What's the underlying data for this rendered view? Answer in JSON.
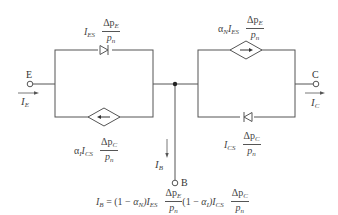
{
  "diagram": {
    "terminals": {
      "emitter": "E",
      "collector": "C",
      "base": "B"
    },
    "currents": {
      "emitter": {
        "symbol": "I",
        "sub": "E"
      },
      "collector": {
        "symbol": "I",
        "sub": "C"
      },
      "base": {
        "symbol": "I",
        "sub": "B"
      }
    },
    "left_branch": {
      "diode_label": {
        "prefix": "I",
        "prefix_sub": "ES",
        "num": "Δp",
        "num_sub": "E",
        "den": "p",
        "den_sub": "n"
      },
      "source_label": {
        "alpha": "α",
        "alpha_sub": "I",
        "prefix": "I",
        "prefix_sub": "CS",
        "num": "Δp",
        "num_sub": "C",
        "den": "p",
        "den_sub": "n"
      },
      "source_direction": "left"
    },
    "right_branch": {
      "source_label": {
        "alpha": "α",
        "alpha_sub": "N",
        "prefix": "I",
        "prefix_sub": "ES",
        "num": "Δp",
        "num_sub": "E",
        "den": "p",
        "den_sub": "n"
      },
      "diode_label": {
        "prefix": "I",
        "prefix_sub": "CS",
        "num": "Δp",
        "num_sub": "C",
        "den": "p",
        "den_sub": "n"
      },
      "source_direction": "right"
    },
    "equation": {
      "lhs": "I",
      "lhs_sub": "B",
      "eq": " = (1 − ",
      "alpha1": "α",
      "alpha1_sub": "N",
      "mid1": ")I",
      "mid1_sub": "ES",
      "frac1_num": "Δp",
      "frac1_num_sub": "E",
      "frac1_den": "p",
      "frac1_den_sub": "n",
      "mid2": "(1 − ",
      "alpha2": "α",
      "alpha2_sub": "I",
      "mid3": ")I",
      "mid3_sub": "CS",
      "frac2_num": "Δp",
      "frac2_num_sub": "C",
      "frac2_den": "p",
      "frac2_den_sub": "n"
    },
    "colors": {
      "wire": "#555555",
      "text": "#444444",
      "background": "#ffffff"
    }
  }
}
